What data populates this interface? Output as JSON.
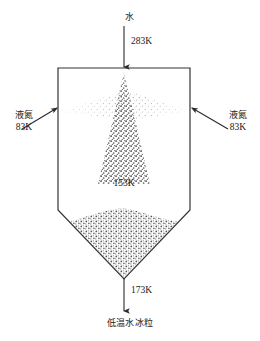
{
  "figure": {
    "type": "process-schematic"
  },
  "inlet_top": {
    "material": "水",
    "temperature": "283K",
    "icon": "down-arrow-icon"
  },
  "inlet_left": {
    "material": "液氮",
    "temperature": "83K",
    "icon": "up-right-arrow-icon"
  },
  "inlet_right": {
    "material": "液氮",
    "temperature": "83K",
    "icon": "up-left-arrow-icon"
  },
  "chamber": {
    "core_temperature": "153K",
    "spray_name": "central-spray-cone",
    "left_plume_name": "left-nitrogen-plume",
    "right_plume_name": "right-nitrogen-plume",
    "bed_name": "ice-particle-bed"
  },
  "outlet_bottom": {
    "temperature": "173K",
    "product": "低温水冰粒",
    "icon": "down-arrow-icon"
  },
  "colors": {
    "stroke": "#333333",
    "text": "#1a1a1a",
    "particle_dark": "#4a4a4a",
    "particle_light": "#b4b4b4",
    "background": "#ffffff"
  }
}
